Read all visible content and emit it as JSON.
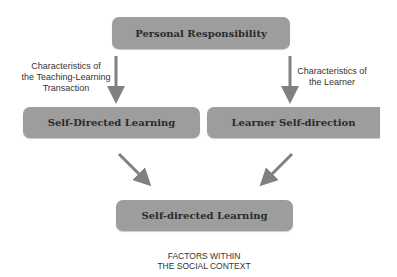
{
  "boxes": {
    "personal_responsibility": "Personal Responsibility",
    "self_directed_learning_left": "Self-Directed Learning",
    "learner_self_direction": "Learner Self-direction",
    "self_directed_learning_result": "Self-directed Learning"
  },
  "labels": {
    "left_line1": "Characteristics of",
    "left_line2": "the Teaching-Learning",
    "left_line3": "Transaction",
    "right_line1": "Characteristics of",
    "right_line2": "the Learner",
    "bottom_line1": "FACTORS WITHIN",
    "bottom_line2": "THE SOCIAL CONTEXT"
  },
  "colors": {
    "box": "#9d9d9d",
    "arrow": "#808080"
  }
}
